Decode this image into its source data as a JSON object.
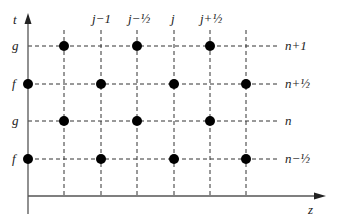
{
  "diagram": {
    "axes": {
      "vertical_label": "t",
      "horizontal_label": "z"
    },
    "column_labels": [
      {
        "text": "j−1",
        "x": 101
      },
      {
        "text": "j−½",
        "x": 137
      },
      {
        "text": "j",
        "x": 174
      },
      {
        "text": "j+½",
        "x": 210
      }
    ],
    "rows": [
      {
        "left_label": "g",
        "right_label": "n+1",
        "y": 46,
        "dots_x": [
          64,
          137,
          210
        ]
      },
      {
        "left_label": "f",
        "right_label": "n+½",
        "y": 84,
        "dots_x": [
          28,
          101,
          174,
          246
        ]
      },
      {
        "left_label": "g",
        "right_label": "n",
        "y": 121,
        "dots_x": [
          64,
          137,
          210
        ]
      },
      {
        "left_label": "f",
        "right_label": "n−½",
        "y": 159,
        "dots_x": [
          28,
          101,
          174,
          246
        ]
      }
    ],
    "vertical_gridlines_x": [
      64,
      101,
      137,
      174,
      210,
      246
    ],
    "colors": {
      "line": "#333333",
      "dot": "#000000",
      "axis": "#555555"
    }
  }
}
